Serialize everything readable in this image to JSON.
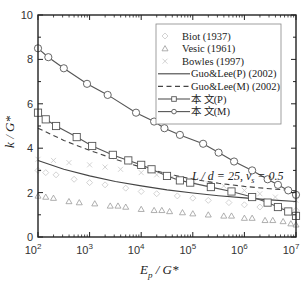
{
  "chart_data": {
    "type": "line",
    "title": "",
    "xlabel": "E_p / G*",
    "ylabel": "k / G*",
    "xscale": "log",
    "xlim": [
      100,
      10000000
    ],
    "ylim": [
      0,
      10
    ],
    "x_ticks": [
      "10^2",
      "10^3",
      "10^4",
      "10^5",
      "10^6",
      "10^7"
    ],
    "y_ticks": [
      "0",
      "2",
      "4",
      "6",
      "8",
      "10"
    ],
    "grid": false,
    "legend_position": "upper right",
    "annotation": "L / d = 25, ν_s = 0.5",
    "series": [
      {
        "name": "Biot  (1937)",
        "style": "marker",
        "marker": "diamond",
        "color": "#c8c8c8",
        "log10x": [
          2.0,
          2.15,
          2.35,
          2.7,
          3.0,
          3.3,
          3.7,
          4.0,
          4.3,
          4.7,
          5.0,
          5.3,
          5.7,
          6.0,
          6.3,
          6.7,
          7.0
        ],
        "values": [
          3.0,
          2.9,
          2.8,
          2.6,
          2.45,
          2.35,
          2.2,
          2.05,
          1.95,
          1.85,
          1.75,
          1.65,
          1.55,
          1.45,
          1.35,
          1.3,
          1.2
        ]
      },
      {
        "name": "Vesic (1961)",
        "style": "marker",
        "marker": "triangle",
        "color": "#9a9a9a",
        "log10x": [
          2.0,
          2.15,
          2.3,
          2.6,
          2.8,
          3.1,
          3.4,
          3.55,
          3.7,
          4.0,
          4.25,
          4.4,
          4.55,
          4.8,
          5.0,
          5.3,
          5.6,
          5.75,
          6.0,
          6.15,
          6.4,
          6.55,
          6.75,
          6.9,
          7.0
        ],
        "values": [
          1.85,
          1.8,
          1.75,
          1.6,
          1.55,
          1.5,
          1.4,
          1.4,
          1.35,
          1.25,
          1.2,
          1.2,
          1.15,
          1.1,
          1.05,
          1.0,
          0.95,
          0.95,
          0.85,
          0.85,
          0.75,
          0.75,
          0.7,
          0.6,
          0.55
        ]
      },
      {
        "name": "Bowles (1997)",
        "style": "marker",
        "marker": "x",
        "color": "#c8c8c8",
        "log10x": [
          2.0,
          2.3,
          2.6,
          3.0,
          3.3,
          3.6,
          4.0,
          4.3,
          4.6,
          5.0,
          5.3,
          5.6,
          6.0,
          6.3,
          6.6,
          7.0
        ],
        "values": [
          3.5,
          3.45,
          3.35,
          3.25,
          3.15,
          3.05,
          2.9,
          2.8,
          2.7,
          2.55,
          2.4,
          2.3,
          2.1,
          1.95,
          1.8,
          1.65
        ]
      },
      {
        "name": "Guo&Lee(P) (2002)",
        "style": "solid",
        "color": "#444444",
        "log10x": [
          2.0,
          2.5,
          3.0,
          3.5,
          4.0,
          4.5,
          5.0,
          5.5,
          6.0,
          6.5,
          7.0
        ],
        "values": [
          3.45,
          3.05,
          2.75,
          2.5,
          2.3,
          2.12,
          1.98,
          1.86,
          1.76,
          1.67,
          1.6
        ]
      },
      {
        "name": "Guo&Lee(M) (2002)",
        "style": "dashed",
        "color": "#444444",
        "log10x": [
          2.0,
          2.5,
          3.0,
          3.5,
          4.0,
          4.5,
          5.0,
          5.5,
          6.0,
          6.5,
          7.0
        ],
        "values": [
          4.9,
          4.35,
          3.9,
          3.5,
          3.15,
          2.85,
          2.6,
          2.42,
          2.28,
          2.17,
          2.08
        ]
      },
      {
        "name": "本 文(P)",
        "style": "solid-marker",
        "marker": "square",
        "color": "#555555",
        "log10x": [
          2.0,
          2.15,
          2.35,
          2.75,
          3.05,
          3.45,
          3.75,
          4.0,
          4.2,
          4.5,
          4.75,
          4.95,
          5.35,
          5.75,
          6.15,
          6.45,
          6.65,
          6.85,
          7.0
        ],
        "values": [
          5.6,
          5.3,
          5.0,
          4.5,
          4.1,
          3.7,
          3.45,
          3.25,
          3.05,
          2.75,
          2.55,
          2.45,
          2.25,
          2.05,
          1.8,
          1.55,
          1.35,
          1.15,
          0.95
        ]
      },
      {
        "name": "本 文(M)",
        "style": "solid-marker",
        "marker": "circle",
        "color": "#555555",
        "log10x": [
          2.0,
          2.2,
          2.5,
          2.95,
          3.35,
          3.9,
          4.25,
          4.45,
          4.75,
          5.2,
          5.5,
          5.8,
          6.15,
          6.45,
          6.65,
          6.85,
          7.0
        ],
        "values": [
          8.5,
          8.1,
          7.6,
          6.9,
          6.4,
          5.6,
          5.2,
          4.9,
          4.6,
          4.2,
          3.8,
          3.4,
          3.0,
          2.6,
          2.35,
          2.1,
          1.9
        ]
      }
    ]
  },
  "labels": {
    "xlabel_main": "E",
    "xlabel_sub": "p",
    "xlabel_rest": " / G*",
    "ylabel": "k / G*",
    "annotation": "L / d = 25, ν",
    "annotation_sub": "s",
    "annotation_rest": " = 0.5"
  }
}
